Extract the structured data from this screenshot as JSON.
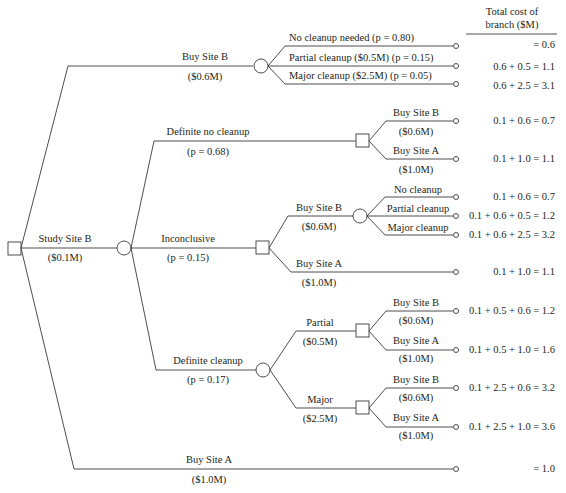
{
  "header": {
    "line1": "Total cost of",
    "line2": "branch ($M)"
  },
  "root": {
    "type": "decision",
    "study": {
      "label": "Study Site B",
      "cost": "($0.1M)"
    },
    "buy_b": {
      "label": "Buy Site B",
      "cost": "($0.6M)",
      "outcomes": [
        {
          "label": "No cleanup needed (p = 0.80)",
          "total": "= 0.6"
        },
        {
          "label": "Partial cleanup ($0.5M) (p = 0.15)",
          "total": "0.6 + 0.5 = 1.1"
        },
        {
          "label": "Major cleanup ($2.5M) (p = 0.05)",
          "total": "0.6 + 2.5 = 3.1"
        }
      ]
    },
    "buy_a": {
      "label": "Buy Site A",
      "cost": "($1.0M)",
      "total": "= 1.0"
    }
  },
  "study_results": {
    "no_cleanup": {
      "label": "Definite no cleanup",
      "prob": "(p = 0.68)",
      "options": [
        {
          "label": "Buy Site B",
          "cost": "($0.6M)",
          "total": "0.1 + 0.6 = 0.7"
        },
        {
          "label": "Buy Site A",
          "cost": "($1.0M)",
          "total": "0.1 + 1.0 = 1.1"
        }
      ]
    },
    "inconclusive": {
      "label": "Inconclusive",
      "prob": "(p = 0.15)",
      "buy_b": {
        "label": "Buy Site B",
        "cost": "($0.6M)",
        "outcomes": [
          {
            "label": "No cleanup",
            "total": "0.1 + 0.6 = 0.7"
          },
          {
            "label": "Partial cleanup",
            "total": "0.1 + 0.6 + 0.5 = 1.2"
          },
          {
            "label": "Major cleanup",
            "total": "0.1 + 0.6 + 2.5 = 3.2"
          }
        ]
      },
      "buy_a": {
        "label": "Buy Site A",
        "cost": "($1.0M)",
        "total": "0.1 + 1.0 = 1.1"
      }
    },
    "cleanup": {
      "label": "Definite cleanup",
      "prob": "(p = 0.17)",
      "partial": {
        "label": "Partial",
        "cost": "($0.5M)",
        "options": [
          {
            "label": "Buy Site B",
            "cost": "($0.6M)",
            "total": "0.1 + 0.5 + 0.6 = 1.2"
          },
          {
            "label": "Buy Site A",
            "cost": "($1.0M)",
            "total": "0.1 + 0.5 + 1.0 = 1.6"
          }
        ]
      },
      "major": {
        "label": "Major",
        "cost": "($2.5M)",
        "options": [
          {
            "label": "Buy Site B",
            "cost": "($0.6M)",
            "total": "0.1 + 2.5 + 0.6 = 3.2"
          },
          {
            "label": "Buy Site A",
            "cost": "($1.0M)",
            "total": "0.1 + 2.5 + 1.0 = 3.6"
          }
        ]
      }
    }
  },
  "legend": {
    "decision_node": "square",
    "chance_node": "circle",
    "terminal_node": "small circle"
  },
  "colors": {
    "line": "#3a3a3a",
    "text": "#231f20",
    "background": "#ffffff"
  }
}
